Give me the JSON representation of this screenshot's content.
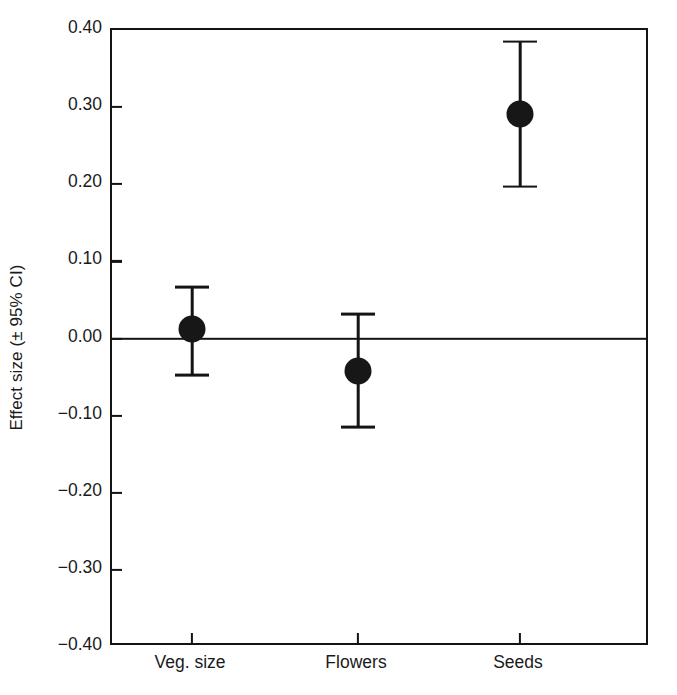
{
  "chart_data": {
    "type": "scatter",
    "title": "",
    "xlabel": "",
    "ylabel": "Effect size (± 95% CI)",
    "categories": [
      "Veg. size",
      "Flowers",
      "Seeds"
    ],
    "values": [
      0.012,
      -0.042,
      0.291
    ],
    "ci_lower": [
      -0.047,
      -0.115,
      0.197
    ],
    "ci_upper": [
      0.067,
      0.032,
      0.385
    ],
    "ylim": [
      -0.4,
      0.4
    ],
    "yticks": [
      0.4,
      0.3,
      0.2,
      0.1,
      0.0,
      -0.1,
      -0.2,
      -0.3,
      -0.4
    ],
    "ytick_labels": [
      "0.40",
      "0.30",
      "0.20",
      "0.10",
      "0.00",
      "−0.10",
      "−0.20",
      "−0.30",
      "−0.40"
    ],
    "grid": false,
    "legend": null,
    "reference_line": 0.0,
    "marker_color": "#171717",
    "axis_color": "#141414",
    "background_color": "#ffffff",
    "points": [
      {
        "category": "Veg. size",
        "value": 0.012,
        "ci_lower": -0.047,
        "ci_upper": 0.067
      },
      {
        "category": "Flowers",
        "value": -0.042,
        "ci_lower": -0.115,
        "ci_upper": 0.032
      },
      {
        "category": "Seeds",
        "value": 0.291,
        "ci_lower": 0.197,
        "ci_upper": 0.385
      }
    ]
  }
}
